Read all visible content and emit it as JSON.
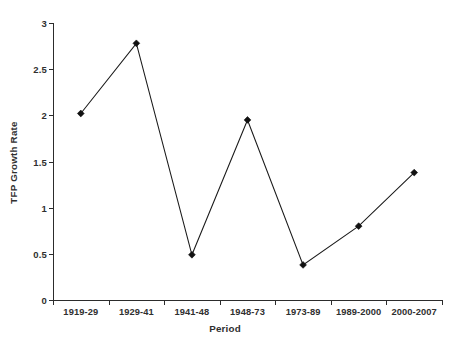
{
  "chart_data": {
    "type": "line",
    "title": "",
    "subtitle": "",
    "xlabel": "Period",
    "ylabel": "TFP Growth Rate",
    "categories": [
      "1919-29",
      "1929-41",
      "1941-48",
      "1948-73",
      "1973-89",
      "1989-2000",
      "2000-2007"
    ],
    "values": [
      2.02,
      2.78,
      0.49,
      1.95,
      0.38,
      0.8,
      1.38
    ],
    "series": [
      {
        "name": "TFP Growth Rate",
        "values": [
          2.02,
          2.78,
          0.49,
          1.95,
          0.38,
          0.8,
          1.38
        ]
      }
    ],
    "ylim": [
      0,
      3
    ],
    "y_ticks": [
      "0",
      "0.5",
      "1",
      "1.5",
      "2",
      "2.5",
      "3"
    ],
    "y_tick_values": [
      0,
      0.5,
      1,
      1.5,
      2,
      2.5,
      3
    ],
    "grid": false,
    "legend": false,
    "legend_position": "none",
    "marker": "diamond",
    "line_color": "#1a1a1a",
    "marker_color": "#111111",
    "axis_color": "#2c2c2c",
    "background_color": "#ffffff",
    "annotations": []
  }
}
